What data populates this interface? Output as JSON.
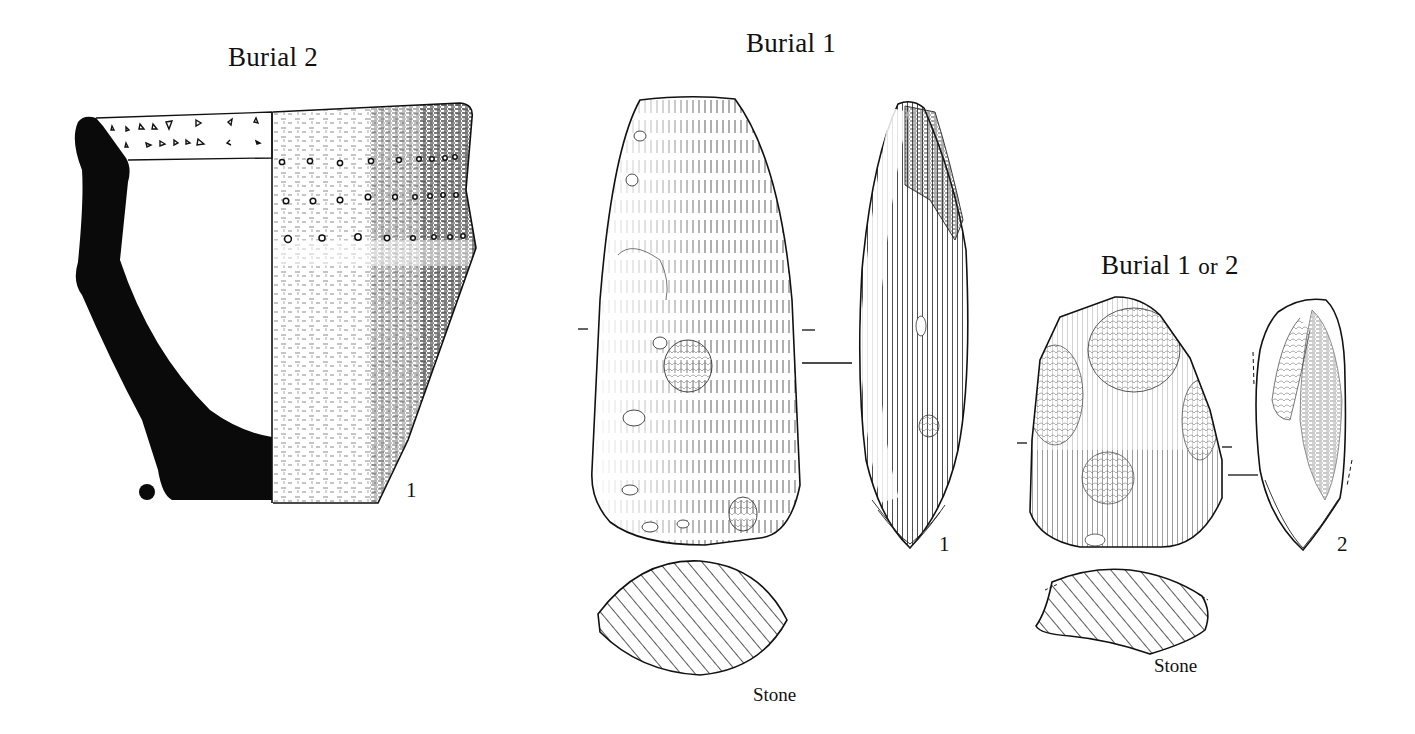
{
  "figure": {
    "groups": [
      {
        "title": "Burial 2",
        "items": [
          {
            "number": "1",
            "object": "pottery-vessel",
            "view": "profile-section-and-exterior"
          }
        ]
      },
      {
        "title": "Burial 1",
        "items": [
          {
            "number": "1",
            "object": "stone-axe",
            "views": [
              "face",
              "side",
              "cross-section"
            ],
            "material": "Stone"
          }
        ]
      },
      {
        "title_main": "Burial 1",
        "title_or": "or",
        "title_end": "2",
        "items": [
          {
            "number": "2",
            "object": "stone-tool",
            "views": [
              "face",
              "side",
              "cross-section"
            ],
            "material": "Stone"
          }
        ]
      }
    ]
  },
  "colors": {
    "ink": "#111111",
    "paper": "#ffffff"
  }
}
